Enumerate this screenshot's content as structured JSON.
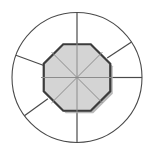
{
  "figure": {
    "type": "geometric-diagram",
    "canvas": {
      "width": 155,
      "height": 156,
      "background": "#ffffff"
    },
    "center": {
      "x": 77,
      "y": 77.5
    },
    "outer_circle": {
      "name": "outer-circle",
      "radius": 65,
      "stroke": "#4a4a4a",
      "stroke_width": 1.1,
      "fill": "none"
    },
    "octagon": {
      "name": "inner-octagon",
      "circumradius": 36,
      "rotation_deg": 22.5,
      "fill": "#d4d4d4",
      "stroke": "#3c3c3c",
      "stroke_width": 2.2,
      "shadow_color": "#b9b9b9",
      "shadow_offset": {
        "x": 2.5,
        "y": 2.5
      },
      "vertex_count": 8
    },
    "inner_spokes": {
      "name": "inner-spokes",
      "count": 8,
      "angles_deg": [
        0,
        45,
        90,
        135,
        180,
        225,
        270,
        315
      ],
      "stroke": "#8c8c8c",
      "stroke_width": 1.0,
      "from_radius": 0,
      "to_radius": 36
    },
    "outer_rays": [
      {
        "name": "ray-up",
        "angle_deg": 90,
        "from_radius": 33,
        "to_radius": 65,
        "stroke": "#4a4a4a",
        "stroke_width": 1.2
      },
      {
        "name": "ray-right",
        "angle_deg": 0,
        "from_radius": 33,
        "to_radius": 65,
        "stroke": "#4a4a4a",
        "stroke_width": 1.2
      },
      {
        "name": "ray-down",
        "angle_deg": 270,
        "from_radius": 33,
        "to_radius": 65,
        "stroke": "#4a4a4a",
        "stroke_width": 1.2
      },
      {
        "name": "ray-upper-right",
        "angle_deg": 33,
        "from_radius": 36,
        "to_radius": 65,
        "stroke": "#4a4a4a",
        "stroke_width": 1.2
      },
      {
        "name": "ray-upper-left",
        "angle_deg": 160,
        "from_radius": 36,
        "to_radius": 65,
        "stroke": "#4a4a4a",
        "stroke_width": 1.2
      },
      {
        "name": "ray-lower-left",
        "angle_deg": 216,
        "from_radius": 36,
        "to_radius": 65,
        "stroke": "#4a4a4a",
        "stroke_width": 1.2
      }
    ]
  }
}
